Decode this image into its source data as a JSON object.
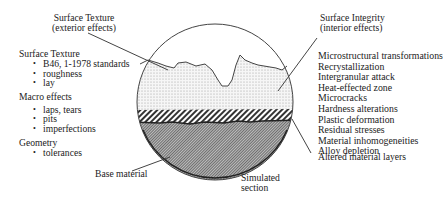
{
  "diagram": {
    "callouts": {
      "surface_texture_top": {
        "line1": "Surface Texture",
        "line2": "(exterior effects)"
      },
      "surface_integrity_top": {
        "line1": "Surface Integrity",
        "line2": "(interior effects)"
      },
      "base_material": "Base material",
      "simulated_section": {
        "line1": "Simulated",
        "line2": "section"
      },
      "altered_layers": "Altered material layers"
    },
    "left_panel": {
      "groups": [
        {
          "heading": "Surface Texture",
          "items": [
            "B46, 1-1978 standards",
            "roughness",
            "lay"
          ]
        },
        {
          "heading": "Macro effects",
          "items": [
            "laps, tears",
            "pits",
            "imperfections"
          ]
        },
        {
          "heading": "Geometry",
          "items": [
            "tolerances"
          ]
        }
      ]
    },
    "right_panel": {
      "items": [
        "Microstructural transformations",
        "Recrystallization",
        "Intergranular attack",
        "Heat-effected zone",
        "Microcracks",
        "Hardness alterations",
        "Plastic deformation",
        "Residual stresses",
        "Material inhomogeneities",
        "Alloy depletion"
      ]
    },
    "colors": {
      "line": "#444444",
      "stipple": "#9a9a9a",
      "base_fill": "#8c8c8c",
      "background": "#ffffff"
    }
  }
}
